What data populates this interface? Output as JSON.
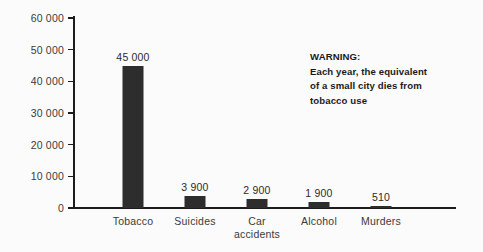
{
  "chart_data": {
    "type": "bar",
    "title": "",
    "subtitle": "",
    "xlabel": "",
    "ylabel": "",
    "categories": [
      "Tobacco",
      "Suicides",
      "Car\naccidents",
      "Alcohol",
      "Murders"
    ],
    "values": [
      45000,
      3900,
      2900,
      1900,
      510
    ],
    "value_labels": [
      "45 000",
      "3 900",
      "2 900",
      "1 900",
      "510"
    ],
    "ylim": [
      0,
      60000
    ],
    "ytick_labels": [
      "0",
      "10 000",
      "20 000",
      "30 000",
      "40 000",
      "50 000",
      "60 000"
    ],
    "ytick_values": [
      0,
      10000,
      20000,
      30000,
      40000,
      50000,
      60000
    ],
    "grid": false,
    "legend": "none",
    "bar_color": "#2d2d2d",
    "axis_color": "#1c1c1c",
    "background_color": "#fbfbfb",
    "annotations": [
      {
        "name": "warning-note",
        "lines": [
          "WARNING:",
          "Each year, the equivalent",
          "of a small city dies from",
          "tobacco use"
        ]
      }
    ]
  }
}
